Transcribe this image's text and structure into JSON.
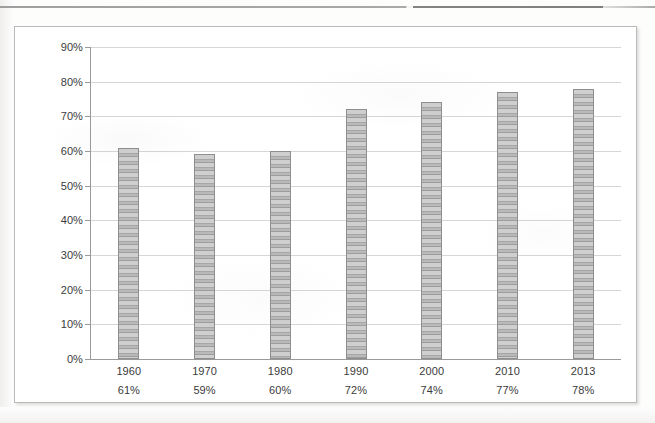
{
  "chart_data": {
    "type": "bar",
    "title": "",
    "subtitle": "",
    "xlabel": "",
    "ylabel": "",
    "categories": [
      "1960",
      "1970",
      "1980",
      "1990",
      "2000",
      "2010",
      "2013"
    ],
    "values": [
      61,
      59,
      60,
      72,
      74,
      77,
      78
    ],
    "value_labels": [
      "61%",
      "59%",
      "60%",
      "72%",
      "74%",
      "77%",
      "78%"
    ],
    "ylim": [
      0,
      90
    ],
    "ytick_labels": [
      "0%",
      "10%",
      "20%",
      "30%",
      "40%",
      "50%",
      "60%",
      "70%",
      "80%",
      "90%"
    ],
    "ytick_values": [
      0,
      10,
      20,
      30,
      40,
      50,
      60,
      70,
      80,
      90
    ],
    "grid": true,
    "legend": null,
    "legend_position": "none",
    "series": [
      {
        "name": "",
        "values": [
          61,
          59,
          60,
          72,
          74,
          77,
          78
        ]
      }
    ],
    "colors": {
      "bar_fill": "#bdbdbd",
      "bar_stripe_light": "#cfcfcf",
      "bar_stripe_dark": "#9d9d9d",
      "bar_border": "#8e8e8e",
      "gridline": "#d6d6d6",
      "axis_line": "#9a9a9a",
      "text": "#3b3b3b",
      "frame_border": "#b9b9b9",
      "background": "#ffffff"
    }
  }
}
